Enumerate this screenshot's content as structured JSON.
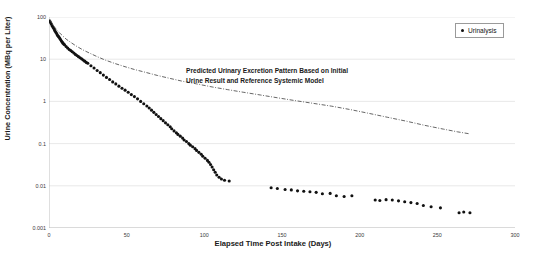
{
  "chart_data": {
    "type": "scatter",
    "title": "",
    "xlabel": "Elapsed Time Post Intake (Days)",
    "ylabel": "Urine Concentration (MBq per Liter)",
    "xlim": [
      0,
      300
    ],
    "ylim": [
      0.001,
      100
    ],
    "yscale": "log",
    "xscale": "linear",
    "grid": true,
    "grid_axis": "y",
    "xticks": [
      0,
      50,
      100,
      150,
      200,
      250,
      300
    ],
    "xticklabels": [
      "0",
      "50",
      "100",
      "150",
      "200",
      "250",
      "300"
    ],
    "yticks": [
      100,
      10,
      1,
      0.1,
      0.01,
      0.001
    ],
    "yticklabels": [
      "100",
      "10",
      "1",
      "0.1",
      "0.01",
      "0.001"
    ],
    "legend": {
      "position": "top-right",
      "entries": [
        {
          "label": "Urinalysis",
          "marker": "circle",
          "color": "#111111"
        }
      ]
    },
    "annotations": [
      {
        "name": "predicted-pattern-note",
        "line1": "Predicted Urinary Excretion Pattern Based on Initial",
        "line2": "Urine Result and Reference Systemic Model",
        "x": 90,
        "y": 2.6
      }
    ],
    "series": [
      {
        "name": "Urinalysis",
        "type": "scatter",
        "marker": "circle",
        "color": "#111111",
        "points": [
          [
            0.5,
            80
          ],
          [
            1.0,
            74
          ],
          [
            1.5,
            68
          ],
          [
            2.0,
            62
          ],
          [
            2.5,
            58
          ],
          [
            3.0,
            54
          ],
          [
            3.5,
            50
          ],
          [
            4.0,
            46
          ],
          [
            4.5,
            43
          ],
          [
            5.0,
            40
          ],
          [
            5.5,
            37
          ],
          [
            6.0,
            35
          ],
          [
            6.5,
            33
          ],
          [
            7.0,
            31
          ],
          [
            7.5,
            29
          ],
          [
            8.0,
            27
          ],
          [
            8.5,
            25.5
          ],
          [
            9.0,
            24
          ],
          [
            9.5,
            23
          ],
          [
            10.0,
            22
          ],
          [
            11.0,
            20
          ],
          [
            12.0,
            18.5
          ],
          [
            13.0,
            17
          ],
          [
            14.0,
            16
          ],
          [
            15.0,
            15
          ],
          [
            16.0,
            14
          ],
          [
            17.0,
            13
          ],
          [
            18.0,
            12.2
          ],
          [
            19.0,
            11.5
          ],
          [
            20.0,
            10.8
          ],
          [
            21.0,
            10.2
          ],
          [
            22.0,
            9.6
          ],
          [
            23.0,
            9.0
          ],
          [
            24.0,
            8.4
          ],
          [
            25.0,
            8.0
          ],
          [
            27.0,
            7.0
          ],
          [
            29.0,
            6.2
          ],
          [
            31.0,
            5.4
          ],
          [
            33.0,
            4.8
          ],
          [
            35.0,
            4.2
          ],
          [
            37.0,
            3.7
          ],
          [
            39.0,
            3.3
          ],
          [
            41.0,
            2.9
          ],
          [
            43.0,
            2.6
          ],
          [
            45.0,
            2.3
          ],
          [
            47.0,
            2.05
          ],
          [
            49.0,
            1.85
          ],
          [
            51.0,
            1.65
          ],
          [
            53.0,
            1.45
          ],
          [
            55.0,
            1.3
          ],
          [
            57.0,
            1.15
          ],
          [
            59.0,
            1.0
          ],
          [
            61.0,
            0.88
          ],
          [
            63.0,
            0.78
          ],
          [
            64.5,
            0.7
          ],
          [
            66.0,
            0.62
          ],
          [
            67.5,
            0.55
          ],
          [
            69.0,
            0.49
          ],
          [
            70.5,
            0.44
          ],
          [
            72.0,
            0.39
          ],
          [
            73.5,
            0.35
          ],
          [
            75.0,
            0.31
          ],
          [
            76.5,
            0.28
          ],
          [
            78.0,
            0.25
          ],
          [
            79.0,
            0.225
          ],
          [
            80.5,
            0.2
          ],
          [
            82.0,
            0.18
          ],
          [
            83.0,
            0.165
          ],
          [
            84.5,
            0.15
          ],
          [
            86.0,
            0.135
          ],
          [
            87.0,
            0.122
          ],
          [
            88.5,
            0.112
          ],
          [
            90.0,
            0.1
          ],
          [
            91.0,
            0.092
          ],
          [
            92.5,
            0.084
          ],
          [
            94.0,
            0.076
          ],
          [
            95.0,
            0.069
          ],
          [
            96.5,
            0.062
          ],
          [
            98.0,
            0.056
          ],
          [
            99.0,
            0.05
          ],
          [
            100.5,
            0.045
          ],
          [
            102.0,
            0.04
          ],
          [
            103.0,
            0.036
          ],
          [
            104.0,
            0.032
          ],
          [
            105.0,
            0.028
          ],
          [
            106.0,
            0.024
          ],
          [
            107.0,
            0.021
          ],
          [
            108.0,
            0.018
          ],
          [
            109.5,
            0.016
          ],
          [
            111.0,
            0.0145
          ],
          [
            113.0,
            0.0135
          ],
          [
            116.0,
            0.013
          ],
          [
            143.0,
            0.009
          ],
          [
            147.0,
            0.0086
          ],
          [
            152.0,
            0.0082
          ],
          [
            156.0,
            0.008
          ],
          [
            160.0,
            0.0076
          ],
          [
            164.0,
            0.0074
          ],
          [
            168.0,
            0.0072
          ],
          [
            172.0,
            0.007
          ],
          [
            176.0,
            0.0065
          ],
          [
            181.0,
            0.0066
          ],
          [
            185.0,
            0.0058
          ],
          [
            190.0,
            0.0056
          ],
          [
            195.0,
            0.0058
          ],
          [
            210.0,
            0.0046
          ],
          [
            213.0,
            0.0045
          ],
          [
            217.0,
            0.0047
          ],
          [
            221.0,
            0.0046
          ],
          [
            225.0,
            0.0044
          ],
          [
            229.0,
            0.0042
          ],
          [
            233.0,
            0.004
          ],
          [
            237.0,
            0.0038
          ],
          [
            241.0,
            0.0034
          ],
          [
            246.0,
            0.0032
          ],
          [
            252.0,
            0.003
          ],
          [
            264.0,
            0.0023
          ],
          [
            267.0,
            0.0024
          ],
          [
            271.0,
            0.0023
          ]
        ]
      },
      {
        "name": "Predicted Urinary Excretion Pattern",
        "type": "line",
        "linestyle": "dashdot",
        "color": "#4a4a4a",
        "points": [
          [
            0.5,
            88
          ],
          [
            2,
            70
          ],
          [
            4,
            55
          ],
          [
            6,
            45
          ],
          [
            8,
            38
          ],
          [
            11,
            30
          ],
          [
            14,
            25
          ],
          [
            18,
            20
          ],
          [
            22,
            16.5
          ],
          [
            26,
            14
          ],
          [
            31,
            11.5
          ],
          [
            36,
            9.6
          ],
          [
            42,
            8.0
          ],
          [
            48,
            6.8
          ],
          [
            55,
            5.7
          ],
          [
            62,
            4.9
          ],
          [
            70,
            4.1
          ],
          [
            78,
            3.5
          ],
          [
            86,
            3.0
          ],
          [
            95,
            2.6
          ],
          [
            105,
            2.2
          ],
          [
            115,
            1.9
          ],
          [
            125,
            1.65
          ],
          [
            136,
            1.42
          ],
          [
            147,
            1.22
          ],
          [
            158,
            1.05
          ],
          [
            170,
            0.9
          ],
          [
            182,
            0.77
          ],
          [
            194,
            0.64
          ],
          [
            206,
            0.52
          ],
          [
            218,
            0.42
          ],
          [
            230,
            0.34
          ],
          [
            242,
            0.27
          ],
          [
            254,
            0.22
          ],
          [
            263,
            0.19
          ],
          [
            271,
            0.17
          ]
        ]
      }
    ]
  }
}
